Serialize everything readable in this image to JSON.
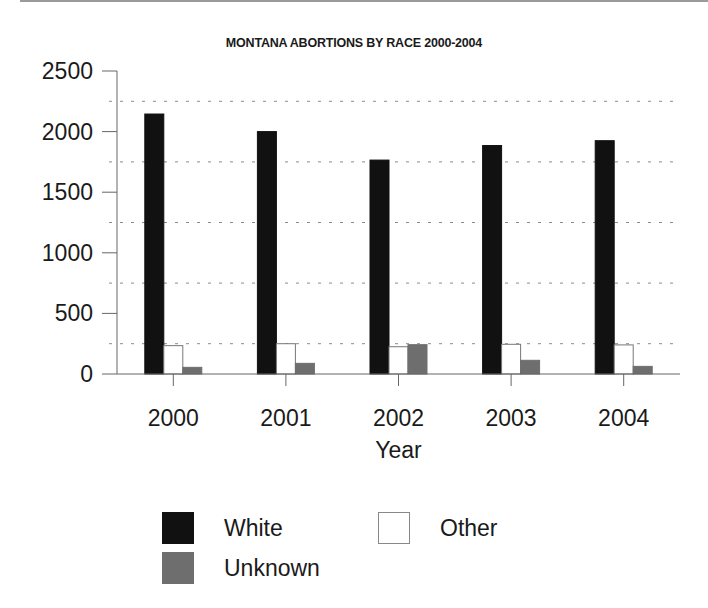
{
  "chart_data": {
    "type": "bar",
    "title": "MONTANA ABORTIONS BY RACE 2000-2004",
    "xlabel": "Year",
    "ylabel": "",
    "categories": [
      "2000",
      "2001",
      "2002",
      "2003",
      "2004"
    ],
    "series": [
      {
        "name": "White",
        "color": "#111111",
        "values": [
          2145,
          2000,
          1765,
          1885,
          1925
        ]
      },
      {
        "name": "Other",
        "color": "#ffffff",
        "values": [
          234,
          250,
          225,
          245,
          240
        ]
      },
      {
        "name": "Unknown",
        "color": "#6e6e6e",
        "values": [
          55,
          88,
          242,
          113,
          63
        ]
      }
    ],
    "ylim": [
      0,
      2500
    ],
    "yticks": [
      "0",
      "500",
      "1000",
      "1500",
      "2000",
      "2500"
    ],
    "grid": {
      "on": true,
      "style": "dotted",
      "values": [
        250,
        750,
        1250,
        1750,
        2250
      ]
    },
    "legend_position": "bottom"
  },
  "legend": {
    "items": [
      {
        "label": "White",
        "color": "#111111"
      },
      {
        "label": "Other",
        "color": "#ffffff"
      },
      {
        "label": "Unknown",
        "color": "#6e6e6e"
      }
    ]
  }
}
